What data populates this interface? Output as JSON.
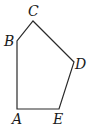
{
  "figure": {
    "type": "pentagon",
    "stroke_color": "#2a2a2a",
    "vertices": [
      {
        "label": "A",
        "x": 17,
        "y": 109,
        "label_x": 12,
        "label_y": 112
      },
      {
        "label": "B",
        "x": 17,
        "y": 41,
        "label_x": 4,
        "label_y": 34
      },
      {
        "label": "C",
        "x": 33,
        "y": 21,
        "label_x": 28,
        "label_y": 4
      },
      {
        "label": "D",
        "x": 74,
        "y": 62,
        "label_x": 75,
        "label_y": 57
      },
      {
        "label": "E",
        "x": 59,
        "y": 109,
        "label_x": 53,
        "label_y": 112
      }
    ]
  }
}
